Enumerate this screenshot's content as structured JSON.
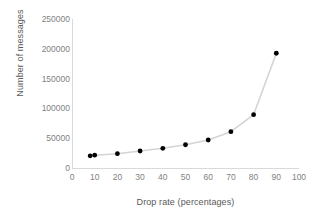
{
  "chart_data": {
    "type": "line",
    "title": "",
    "xlabel": "Drop rate (percentages)",
    "ylabel": "Number of messages",
    "xlim": [
      0,
      100
    ],
    "ylim": [
      0,
      250000
    ],
    "grid": false,
    "legend": false,
    "x_ticks": [
      "0",
      "10",
      "20",
      "30",
      "40",
      "50",
      "60",
      "70",
      "80",
      "90",
      "100"
    ],
    "x_tick_values": [
      0,
      10,
      20,
      30,
      40,
      50,
      60,
      70,
      80,
      90,
      100
    ],
    "y_ticks": [
      "0",
      "50000",
      "100000",
      "150000",
      "200000",
      "250000"
    ],
    "y_tick_values": [
      0,
      50000,
      100000,
      150000,
      200000,
      250000
    ],
    "series": [
      {
        "name": "Number of messages",
        "marker": "circle",
        "marker_color": "#000000",
        "line_color": "#d4d4d4",
        "x": [
          8,
          10,
          20,
          30,
          40,
          50,
          60,
          70,
          80,
          90
        ],
        "values": [
          20500,
          21500,
          24000,
          28500,
          33000,
          39000,
          47000,
          61000,
          89500,
          192500
        ]
      }
    ]
  },
  "axes": {
    "y_title": "Number of messages",
    "x_title": "Drop rate (percentages)"
  },
  "colors": {
    "axis_line": "#d9d9d9",
    "tick_text": "#7f7f7f",
    "title_text": "#595959",
    "line": "#d4d4d4",
    "marker": "#000000",
    "background": "#ffffff"
  }
}
